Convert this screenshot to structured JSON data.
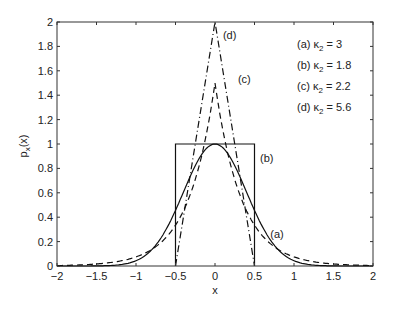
{
  "chart_data": {
    "type": "line",
    "title": "",
    "xlabel": "x",
    "ylabel": "p_x(x)",
    "xlim": [
      -2,
      2
    ],
    "ylim": [
      0,
      2
    ],
    "xticks": [
      "-2",
      "-1.5",
      "-1",
      "-0.5",
      "0",
      "0.5",
      "1",
      "1.5",
      "2"
    ],
    "yticks": [
      "0",
      "0.2",
      "0.4",
      "0.6",
      "0.8",
      "1",
      "1.2",
      "1.4",
      "1.6",
      "1.8",
      "2"
    ],
    "grid": false,
    "legend_position": "upper right (inside)",
    "legend": [
      {
        "label": "(a)",
        "kappa_sub": "2",
        "value": "3"
      },
      {
        "label": "(b)",
        "kappa_sub": "2",
        "value": "1.8"
      },
      {
        "label": "(c)",
        "kappa_sub": "2",
        "value": "2.2"
      },
      {
        "label": "(d)",
        "kappa_sub": "2",
        "value": "5.6"
      }
    ],
    "series": [
      {
        "name": "(a) Gaussian",
        "style": "solid",
        "kappa2": 3,
        "description": "Gaussian, peak 1 at x=0",
        "x": [
          -1.5,
          -1,
          -0.75,
          -0.5,
          -0.25,
          0,
          0.25,
          0.5,
          0.75,
          1,
          1.5
        ],
        "values": [
          0.0008,
          0.043,
          0.17,
          0.46,
          0.82,
          1,
          0.82,
          0.46,
          0.17,
          0.043,
          0.0008
        ]
      },
      {
        "name": "(b) Uniform",
        "style": "solid",
        "kappa2": 1.8,
        "description": "Uniform on [-0.5, 0.5], height 1",
        "x": [
          -0.5,
          -0.5,
          0.5,
          0.5
        ],
        "values": [
          0,
          1,
          1,
          0
        ]
      },
      {
        "name": "(c) Laplacian",
        "style": "dashed",
        "kappa2": 2.2,
        "description": "Double exponential, peak 1.5",
        "x": [
          -1.25,
          -1,
          -0.75,
          -0.5,
          -0.25,
          0,
          0.25,
          0.5,
          0.75,
          1,
          1.25
        ],
        "values": [
          0.035,
          0.075,
          0.16,
          0.33,
          0.71,
          1.5,
          0.71,
          0.33,
          0.16,
          0.075,
          0.035
        ]
      },
      {
        "name": "(d) Triangular",
        "style": "dash-dot",
        "kappa2": 5.6,
        "description": "Triangle on [-0.5, 0.5], peak 2",
        "x": [
          -0.5,
          0,
          0.5
        ],
        "values": [
          0,
          2,
          0
        ]
      }
    ],
    "annotations": [
      {
        "text": "(a)",
        "x": 0.7,
        "y": 0.23
      },
      {
        "text": "(b)",
        "x": 0.57,
        "y": 0.85
      },
      {
        "text": "(c)",
        "x": 0.29,
        "y": 1.5
      },
      {
        "text": "(d)",
        "x": 0.1,
        "y": 1.86
      }
    ]
  }
}
